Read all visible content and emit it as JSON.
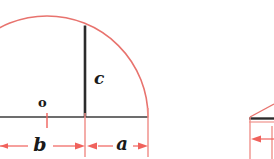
{
  "figure": {
    "colors": {
      "arc": "#e8736e",
      "dimension": "#f0625c",
      "solid_line": "#2b2b2b",
      "baseline": "#3c3c3c",
      "background": "#ffffff"
    },
    "labels": {
      "height_segment": "c",
      "right_segment": "a",
      "left_segment": "b",
      "center_point": "o"
    },
    "geometry": {
      "center_x": 47,
      "baseline_y": 117,
      "radius": 101,
      "arc_left_x": -54,
      "arc_right_x": 148,
      "perpendicular_x": 85,
      "perpendicular_top_y": 25,
      "baseline_start_x": 0,
      "baseline_end_x": 148,
      "dimension_y": 146,
      "segment_a_from": 85,
      "segment_a_to": 148,
      "segment_b_from": 0,
      "segment_b_to": 85
    }
  },
  "second_figure": {
    "label": "partial adjacent figure",
    "bar_y": 118,
    "bar_left_x": 249,
    "arrow_y": 139
  }
}
